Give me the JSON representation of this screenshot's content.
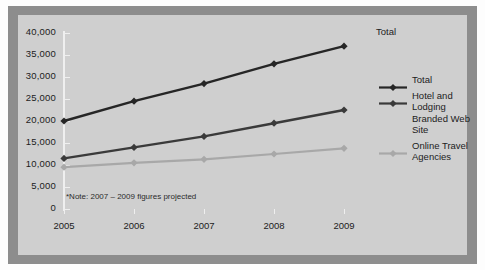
{
  "figure": {
    "frame_color": "#8d8d8d",
    "panel_color": "#cfcfcf",
    "page_color": "#fdfdfd"
  },
  "annotation": {
    "total_label": "Total",
    "note": "*Note: 2007 – 2009 figures projected"
  },
  "legend": {
    "position": "right",
    "items": [
      {
        "label": "Total",
        "color": "#262626",
        "marker": "diamond"
      },
      {
        "label": "Hotel and Lodging Branded Web Site",
        "color": "#3a3a3a",
        "marker": "diamond"
      },
      {
        "label": "Online Travel Agencies",
        "color": "#a8a8a8",
        "marker": "diamond"
      }
    ]
  },
  "chart_data": {
    "type": "line",
    "title": "",
    "subtitle": "",
    "xlabel": "",
    "ylabel": "",
    "categories": [
      "2005",
      "2006",
      "2007",
      "2008",
      "2009"
    ],
    "x": [
      2005,
      2006,
      2007,
      2008,
      2009
    ],
    "xtick_labels": [
      "2005",
      "2006",
      "2007",
      "2008",
      "2009"
    ],
    "ytick_labels": [
      "0",
      "5,000",
      "10,000",
      "15,000",
      "20,000",
      "25,000",
      "30,000",
      "35,000",
      "40,000"
    ],
    "ytick_values": [
      0,
      5000,
      10000,
      15000,
      20000,
      25000,
      30000,
      35000,
      40000
    ],
    "ylim": [
      0,
      40000
    ],
    "grid": false,
    "legend_position": "right",
    "annotations": [
      {
        "text": "Total",
        "near_point": {
          "x": 2009,
          "y": 37000
        }
      },
      {
        "text": "*Note: 2007 – 2009 figures projected",
        "position": "inside-bottom-left"
      }
    ],
    "series": [
      {
        "name": "Total",
        "color": "#262626",
        "values": [
          20000,
          24500,
          28500,
          33000,
          37000
        ]
      },
      {
        "name": "Hotel and Lodging Branded Web Site",
        "color": "#3a3a3a",
        "values": [
          11500,
          14000,
          16500,
          19500,
          22500
        ]
      },
      {
        "name": "Online Travel Agencies",
        "color": "#a8a8a8",
        "values": [
          9500,
          10500,
          11300,
          12500,
          13800
        ]
      }
    ]
  }
}
